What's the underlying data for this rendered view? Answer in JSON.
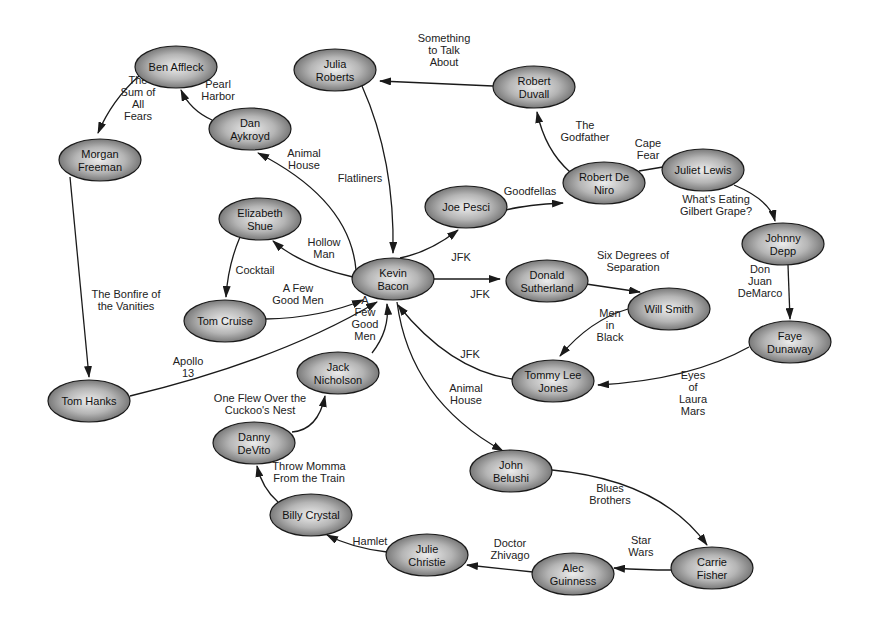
{
  "colors": {
    "node_center": "#e8e8e8",
    "node_edge": "#6a6a6a",
    "stroke": "#1a1a1a",
    "background": "#ffffff"
  },
  "nodes": [
    {
      "id": "ben_affleck",
      "lines": [
        "Ben Affleck"
      ],
      "cx": 176,
      "cy": 67,
      "rx": 41,
      "ry": 21
    },
    {
      "id": "julia_roberts",
      "lines": [
        "Julia",
        "Roberts"
      ],
      "cx": 335,
      "cy": 70,
      "rx": 41,
      "ry": 21
    },
    {
      "id": "robert_duvall",
      "lines": [
        "Robert",
        "Duvall"
      ],
      "cx": 534,
      "cy": 87,
      "rx": 41,
      "ry": 21
    },
    {
      "id": "dan_aykroyd",
      "lines": [
        "Dan",
        "Aykroyd"
      ],
      "cx": 250,
      "cy": 129,
      "rx": 41,
      "ry": 21
    },
    {
      "id": "morgan_freeman",
      "lines": [
        "Morgan",
        "Freeman"
      ],
      "cx": 100,
      "cy": 160,
      "rx": 41,
      "ry": 21
    },
    {
      "id": "robert_de_niro",
      "lines": [
        "Robert De",
        "Niro"
      ],
      "cx": 604,
      "cy": 183,
      "rx": 41,
      "ry": 21
    },
    {
      "id": "juliet_lewis",
      "lines": [
        "Juliet Lewis"
      ],
      "cx": 703,
      "cy": 170,
      "rx": 41,
      "ry": 21
    },
    {
      "id": "joe_pesci",
      "lines": [
        "Joe Pesci"
      ],
      "cx": 466,
      "cy": 207,
      "rx": 41,
      "ry": 21
    },
    {
      "id": "elizabeth_shue",
      "lines": [
        "Elizabeth",
        "Shue"
      ],
      "cx": 260,
      "cy": 219,
      "rx": 41,
      "ry": 21
    },
    {
      "id": "johnny_depp",
      "lines": [
        "Johnny",
        "Depp"
      ],
      "cx": 783,
      "cy": 244,
      "rx": 41,
      "ry": 21
    },
    {
      "id": "kevin_bacon",
      "lines": [
        "Kevin",
        "Bacon"
      ],
      "cx": 393,
      "cy": 279,
      "rx": 41,
      "ry": 21
    },
    {
      "id": "donald_sutherland",
      "lines": [
        "Donald",
        "Sutherland"
      ],
      "cx": 547,
      "cy": 281,
      "rx": 41,
      "ry": 21
    },
    {
      "id": "tom_cruise",
      "lines": [
        "Tom Cruise"
      ],
      "cx": 225,
      "cy": 321,
      "rx": 41,
      "ry": 21
    },
    {
      "id": "will_smith",
      "lines": [
        "Will Smith"
      ],
      "cx": 669,
      "cy": 309,
      "rx": 41,
      "ry": 21
    },
    {
      "id": "faye_dunaway",
      "lines": [
        "Faye",
        "Dunaway"
      ],
      "cx": 790,
      "cy": 342,
      "rx": 41,
      "ry": 21
    },
    {
      "id": "jack_nicholson",
      "lines": [
        "Jack",
        "Nicholson"
      ],
      "cx": 338,
      "cy": 373,
      "rx": 41,
      "ry": 21
    },
    {
      "id": "tommy_lee_jones",
      "lines": [
        "Tommy Lee",
        "Jones"
      ],
      "cx": 553,
      "cy": 381,
      "rx": 41,
      "ry": 21
    },
    {
      "id": "tom_hanks",
      "lines": [
        "Tom Hanks"
      ],
      "cx": 89,
      "cy": 401,
      "rx": 41,
      "ry": 21
    },
    {
      "id": "danny_devito",
      "lines": [
        "Danny",
        "DeVito"
      ],
      "cx": 254,
      "cy": 443,
      "rx": 41,
      "ry": 21
    },
    {
      "id": "john_belushi",
      "lines": [
        "John",
        "Belushi"
      ],
      "cx": 511,
      "cy": 471,
      "rx": 41,
      "ry": 21
    },
    {
      "id": "billy_crystal",
      "lines": [
        "Billy Crystal"
      ],
      "cx": 311,
      "cy": 515,
      "rx": 41,
      "ry": 21
    },
    {
      "id": "julie_christie",
      "lines": [
        "Julie",
        "Christie"
      ],
      "cx": 427,
      "cy": 555,
      "rx": 41,
      "ry": 21
    },
    {
      "id": "alec_guinness",
      "lines": [
        "Alec",
        "Guinness"
      ],
      "cx": 573,
      "cy": 574,
      "rx": 41,
      "ry": 21
    },
    {
      "id": "carrie_fisher",
      "lines": [
        "Carrie",
        "Fisher"
      ],
      "cx": 712,
      "cy": 568,
      "rx": 41,
      "ry": 21
    }
  ],
  "edges": [
    {
      "from": "ben_affleck",
      "to": "morgan_freeman",
      "label": [
        "The",
        "Sum of",
        "All",
        "Fears"
      ],
      "path": "M 139 76 Q 112 100 98 133",
      "lx": 138,
      "ly": 98
    },
    {
      "from": "dan_aykroyd",
      "to": "ben_affleck",
      "label": [
        "Pearl",
        "Harbor"
      ],
      "path": "M 212 120 Q 190 110 181 90",
      "lx": 218,
      "ly": 90
    },
    {
      "from": "kevin_bacon",
      "to": "dan_aykroyd",
      "label": [
        "Animal",
        "House"
      ],
      "path": "M 356 270 Q 350 200 258 153",
      "lx": 304,
      "ly": 159
    },
    {
      "from": "julia_roberts",
      "to": "kevin_bacon",
      "label": [
        "Flatliners"
      ],
      "path": "M 362 86 Q 395 160 393 253",
      "lx": 360,
      "ly": 178
    },
    {
      "from": "robert_duvall",
      "to": "julia_roberts",
      "label": [
        "Something",
        "to Talk",
        "About"
      ],
      "path": "M 493 86 L 380 81",
      "lx": 444,
      "ly": 50
    },
    {
      "from": "robert_de_niro",
      "to": "robert_duvall",
      "label": [
        "The",
        "Godfather"
      ],
      "path": "M 570 172 Q 545 150 537 112",
      "lx": 585,
      "ly": 131
    },
    {
      "from": "robert_de_niro",
      "to": "juliet_lewis",
      "label": [
        "Cape",
        "Fear"
      ],
      "path": "M 639 171 L 681 164",
      "lx": 648,
      "ly": 149
    },
    {
      "from": "juliet_lewis",
      "to": "johnny_depp",
      "label": [
        "What's Eating",
        "Gilbert Grape?"
      ],
      "path": "M 734 185 Q 770 200 775 221",
      "lx": 716,
      "ly": 205
    },
    {
      "from": "johnny_depp",
      "to": "faye_dunaway",
      "label": [
        "Don",
        "Juan",
        "DeMarco"
      ],
      "path": "M 788 265 L 790 319",
      "lx": 760,
      "ly": 281
    },
    {
      "from": "faye_dunaway",
      "to": "tommy_lee_jones",
      "label": [
        "Eyes",
        "of",
        "Laura",
        "Mars"
      ],
      "path": "M 749 347 Q 690 380 598 385",
      "lx": 693,
      "ly": 393
    },
    {
      "from": "joe_pesci",
      "to": "robert_de_niro",
      "label": [
        "Goodfellas"
      ],
      "path": "M 506 210 Q 525 205 563 203",
      "lx": 530,
      "ly": 191
    },
    {
      "from": "kevin_bacon",
      "to": "joe_pesci",
      "label": [
        "JFK"
      ],
      "path": "M 400 258 Q 430 252 458 230",
      "lx": 461,
      "ly": 257
    },
    {
      "from": "kevin_bacon",
      "to": "elizabeth_shue",
      "label": [
        "Hollow",
        "Man"
      ],
      "path": "M 353 277 Q 300 265 273 241",
      "lx": 324,
      "ly": 248
    },
    {
      "from": "kevin_bacon",
      "to": "donald_sutherland",
      "label": [
        "JFK"
      ],
      "path": "M 434 279 L 500 279",
      "lx": 480,
      "ly": 294
    },
    {
      "from": "donald_sutherland",
      "to": "will_smith",
      "label": [
        "Six Degrees of",
        "Separation"
      ],
      "path": "M 586 284 L 640 292",
      "lx": 633,
      "ly": 261
    },
    {
      "from": "will_smith",
      "to": "tommy_lee_jones",
      "label": [
        "Men",
        "in",
        "Black"
      ],
      "path": "M 628 309 Q 590 320 560 356",
      "lx": 610,
      "ly": 325
    },
    {
      "from": "tommy_lee_jones",
      "to": "kevin_bacon",
      "label": [
        "JFK"
      ],
      "path": "M 512 379 Q 450 370 398 305",
      "lx": 470,
      "ly": 354
    },
    {
      "from": "elizabeth_shue",
      "to": "tom_cruise",
      "label": [
        "Cocktail"
      ],
      "path": "M 240 237 Q 228 265 226 297",
      "lx": 255,
      "ly": 270
    },
    {
      "from": "tom_cruise",
      "to": "kevin_bacon",
      "label": [
        "A Few",
        "Good Men"
      ],
      "path": "M 266 319 Q 320 318 363 300",
      "lx": 298,
      "ly": 294
    },
    {
      "from": "jack_nicholson",
      "to": "kevin_bacon",
      "label": [
        "A",
        "Few",
        "Good",
        "Men"
      ],
      "path": "M 372 353 Q 390 330 387 304",
      "lx": 365,
      "ly": 318
    },
    {
      "from": "tom_hanks",
      "to": "kevin_bacon",
      "label": [
        "Apollo",
        "13"
      ],
      "path": "M 130 396 Q 280 360 377 302",
      "lx": 188,
      "ly": 367
    },
    {
      "from": "morgan_freeman",
      "to": "tom_hanks",
      "label": [
        "The Bonfire of",
        "the Vanities"
      ],
      "path": "M 70 177 Q 80 280 89 377",
      "lx": 126,
      "ly": 300
    },
    {
      "from": "danny_devito",
      "to": "jack_nicholson",
      "label": [
        "One Flew Over the",
        "Cuckoo's Nest"
      ],
      "path": "M 292 432 Q 318 430 325 396",
      "lx": 260,
      "ly": 404
    },
    {
      "from": "billy_crystal",
      "to": "danny_devito",
      "label": [
        "Throw Momma",
        "From the Train"
      ],
      "path": "M 278 502 Q 262 488 257 466",
      "lx": 309,
      "ly": 472
    },
    {
      "from": "julie_christie",
      "to": "billy_crystal",
      "label": [
        "Hamlet"
      ],
      "path": "M 387 552 Q 352 548 327 535",
      "lx": 370,
      "ly": 541
    },
    {
      "from": "alec_guinness",
      "to": "julie_christie",
      "label": [
        "Doctor",
        "Zhivago"
      ],
      "path": "M 533 572 L 467 565",
      "lx": 510,
      "ly": 549
    },
    {
      "from": "carrie_fisher",
      "to": "alec_guinness",
      "label": [
        "Star",
        "Wars"
      ],
      "path": "M 671 570 Q 645 570 614 568",
      "lx": 641,
      "ly": 546
    },
    {
      "from": "john_belushi",
      "to": "carrie_fisher",
      "label": [
        "Blues",
        "Brothers"
      ],
      "path": "M 552 470 Q 660 480 707 545",
      "lx": 610,
      "ly": 494
    },
    {
      "from": "kevin_bacon",
      "to": "john_belushi",
      "label": [
        "Animal",
        "House"
      ],
      "path": "M 397 302 Q 410 400 503 451",
      "lx": 466,
      "ly": 394
    }
  ]
}
